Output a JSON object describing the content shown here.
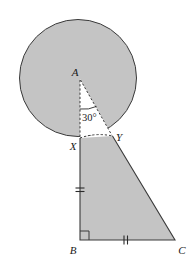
{
  "figure": {
    "kind": "geometry-diagram",
    "canvas": {
      "width": 195,
      "height": 262
    },
    "background_color": "#ffffff",
    "fill_color": "#c4c4c4",
    "stroke_color": "#3a3a3a",
    "white_color": "#ffffff",
    "labels": {
      "a": "A",
      "b": "B",
      "c": "C",
      "x": "X",
      "y": "Y",
      "angle": "30°"
    },
    "points": {
      "A": {
        "x": 80,
        "y": 79
      },
      "X": {
        "x": 80,
        "y": 138
      },
      "Y": {
        "x": 112.5,
        "y": 136
      },
      "B": {
        "x": 80,
        "y": 240
      },
      "C": {
        "x": 175,
        "y": 240
      }
    },
    "circle": {
      "cx": 78,
      "cy": 78,
      "r": 59
    },
    "angle_arc": {
      "vertex": "A",
      "measure_degrees": 30,
      "radius": 30
    },
    "tick_marks": {
      "segment_xb": {
        "count": 2,
        "label": "congruent"
      },
      "segment_bc": {
        "count": 2,
        "label": "congruent"
      }
    },
    "right_angle": {
      "at": "B",
      "size": 9
    }
  }
}
